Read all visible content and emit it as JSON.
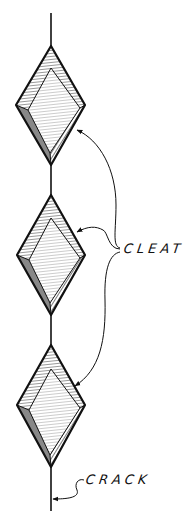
{
  "diagram": {
    "labels": {
      "cleat": "CLEAT",
      "crack": "CRACK"
    },
    "colors": {
      "ink": "#111111",
      "background": "#ffffff"
    },
    "crack_line": {
      "x": 51,
      "y_start": 13,
      "y_end": 511
    },
    "cleats": [
      {
        "name": "cleat-1",
        "top": [
          51,
          46
        ],
        "left": [
          16,
          105
        ],
        "right": [
          85,
          105
        ],
        "bottom": [
          51,
          165
        ]
      },
      {
        "name": "cleat-2",
        "top": [
          51,
          195
        ],
        "left": [
          17,
          255
        ],
        "right": [
          85,
          255
        ],
        "bottom": [
          51,
          315
        ]
      },
      {
        "name": "cleat-3",
        "top": [
          51,
          345
        ],
        "left": [
          17,
          405
        ],
        "right": [
          85,
          405
        ],
        "bottom": [
          51,
          467
        ]
      }
    ]
  }
}
